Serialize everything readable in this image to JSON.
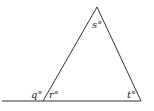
{
  "diagram": {
    "type": "triangle-with-exterior-angle",
    "labels": {
      "q": "q°",
      "r": "r°",
      "s": "s°",
      "t": "t°"
    },
    "vertices": {
      "apex": [
        97,
        7
      ],
      "bottom_left": [
        43,
        101
      ],
      "bottom_right": [
        141,
        101
      ]
    },
    "baseline": {
      "x1": 2,
      "x2": 141,
      "y": 101
    },
    "line_color": "#333333"
  }
}
